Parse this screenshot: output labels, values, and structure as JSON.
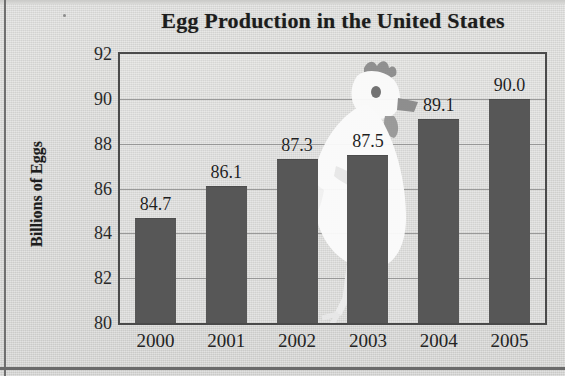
{
  "chart_data": {
    "type": "bar",
    "title": "Egg Production in the United States",
    "xlabel": "",
    "ylabel": "Billions of Eggs",
    "categories": [
      "2000",
      "2001",
      "2002",
      "2003",
      "2004",
      "2005"
    ],
    "values": [
      84.7,
      86.1,
      87.3,
      87.5,
      89.1,
      90.0
    ],
    "data_labels": [
      "84.7",
      "86.1",
      "87.3",
      "87.5",
      "89.1",
      "90.0"
    ],
    "ylim": [
      80,
      92
    ],
    "yticks": [
      92,
      90,
      88,
      86,
      84,
      82,
      80
    ],
    "ytick_labels": [
      "92",
      "90",
      "88",
      "86",
      "84",
      "82",
      "80"
    ],
    "grid": true,
    "grid_axis": "y",
    "legend": null,
    "legend_position": "none",
    "bar_color": "#575757",
    "plot_border_color": "#4a4a4a",
    "gridline_color": "#8c8c8c",
    "background_color": "#d9d9d7",
    "text_color": "#1d1d1d",
    "watermark": "chicken-hen-illustration"
  }
}
